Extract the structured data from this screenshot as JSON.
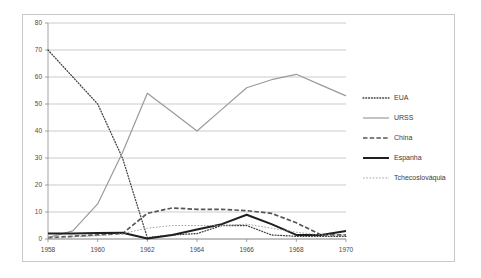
{
  "chart_data": {
    "type": "line",
    "title": "",
    "subtitle": "",
    "xlabel": "",
    "ylabel": "",
    "xlim": [
      1958,
      1970
    ],
    "ylim": [
      0,
      80
    ],
    "yticks": [
      0,
      10,
      20,
      30,
      40,
      50,
      60,
      70,
      80
    ],
    "ytick_labels": [
      "0",
      "10",
      "20",
      "30",
      "40",
      "50",
      "60",
      "70",
      "80"
    ],
    "xticks": [
      1958,
      1960,
      1962,
      1964,
      1966,
      1968,
      1970
    ],
    "xtick_labels": [
      "1958",
      "1960",
      "1962",
      "1964",
      "1966",
      "1968",
      "1970"
    ],
    "grid": "horizontal",
    "legend_position": "right",
    "x": [
      1958,
      1959,
      1960,
      1961,
      1962,
      1963,
      1964,
      1965,
      1966,
      1967,
      1968,
      1969,
      1970
    ],
    "series": [
      {
        "name": "EUA",
        "style": "fine-dotted",
        "color": "#404040",
        "values": [
          70,
          60,
          50,
          30,
          0.5,
          1.5,
          2,
          5,
          5,
          1.5,
          1,
          1,
          1
        ]
      },
      {
        "name": "URSS",
        "style": "solid-thin",
        "color": "#9a9a9a",
        "values": [
          0.5,
          3,
          13,
          32,
          54,
          47,
          40,
          48,
          56,
          59,
          61,
          57,
          53
        ]
      },
      {
        "name": "China",
        "style": "dashed",
        "color": "#555555",
        "values": [
          0.5,
          1,
          1.5,
          2,
          9.5,
          11.5,
          11,
          11,
          10.5,
          9.5,
          6,
          1.5,
          1.5
        ]
      },
      {
        "name": "Espanha",
        "style": "solid-thick",
        "color": "#1f1f1f",
        "values": [
          2,
          2,
          2.2,
          2.3,
          0.2,
          1.5,
          3.5,
          5.5,
          9,
          5.5,
          1.5,
          1.5,
          3
        ]
      },
      {
        "name": "Tchecoslováquia",
        "style": "light-dotted",
        "color": "#9a9a9a",
        "values": [
          0.5,
          0.8,
          1.2,
          2,
          4,
          5,
          5,
          5,
          5.5,
          4,
          2.5,
          1.5,
          1.5
        ]
      }
    ]
  },
  "legend": {
    "items": [
      {
        "label": "EUA"
      },
      {
        "label": "URSS"
      },
      {
        "label": "China"
      },
      {
        "label": "Espanha"
      },
      {
        "label": "Tchecoslováquia"
      }
    ]
  }
}
